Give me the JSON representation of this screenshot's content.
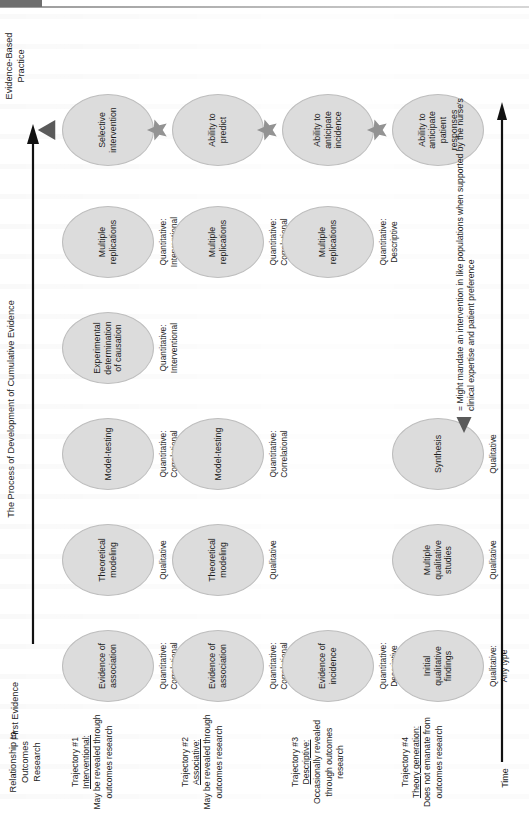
{
  "figure": {
    "process_axis_label": "The Process of Development of Cumulative Evidence",
    "time_axis_label": "Time",
    "first_evidence_header": "First Evidence",
    "evidence_based_practice_header": "Evidence-Based\nPractice",
    "row_descriptor_header": "Relationship to\nOutcomes\nResearch"
  },
  "colors": {
    "node_fill": "#dcdcdc",
    "node_stroke": "#bdbdbd",
    "marker_gray": "#939393",
    "triangle_dark": "#5a5a5a",
    "text": "#1d1d1d",
    "axis": "#111111",
    "page": "#ffffff"
  },
  "legend": {
    "marker": "triangle",
    "equals_sign": "=",
    "text": "Might mandate an intervention in like populations when supported by the nurse's clinical expertise and patient preference"
  },
  "rows": [
    {
      "id": "trajectory-1",
      "name": "Trajectory #1",
      "kind": "Interventional:",
      "note": "May be revealed through outcomes research",
      "end_marker": "triangle",
      "nodes": [
        {
          "col": 0,
          "label": "Evidence of association",
          "sublabel": "Quantitative:\nCorrelational"
        },
        {
          "col": 1,
          "label": "Theoretical modeling",
          "sublabel": "Qualitative"
        },
        {
          "col": 2,
          "label": "Model-testing",
          "sublabel": "Quantitative:\nCorrelational"
        },
        {
          "col": 3,
          "label": "Experimental determination of causation",
          "sublabel": "Quantitative:\nInterventional"
        },
        {
          "col": 4,
          "label": "Multiple replications",
          "sublabel": "Quantitative:\nInterventional"
        },
        {
          "col": 5,
          "label": "Selective intervention",
          "sublabel": ""
        }
      ]
    },
    {
      "id": "trajectory-2",
      "name": "Trajectory #2",
      "kind": "Associative:",
      "note": "May be revealed through outcomes research",
      "end_marker": "star",
      "nodes": [
        {
          "col": 0,
          "label": "Evidence of association",
          "sublabel": "Quantitative:\nCorrelational"
        },
        {
          "col": 1,
          "label": "Theoretical modeling",
          "sublabel": "Qualitative"
        },
        {
          "col": 2,
          "label": "Model-testing",
          "sublabel": "Quantitative:\nCorrelational"
        },
        {
          "col": 4,
          "label": "Multiple replications",
          "sublabel": "Quantitative:\nCorrelational"
        },
        {
          "col": 5,
          "label": "Ability to predict",
          "sublabel": ""
        }
      ]
    },
    {
      "id": "trajectory-3",
      "name": "Trajectory #3",
      "kind": "Descriptive:",
      "note": "Occasionally revealed through outcomes research",
      "end_marker": "star",
      "nodes": [
        {
          "col": 0,
          "label": "Evidence of incidence",
          "sublabel": "Quantitative:\nDescriptive"
        },
        {
          "col": 4,
          "label": "Multiple replications",
          "sublabel": "Quantitative:\nDescriptive"
        },
        {
          "col": 5,
          "label": "Ability to anticipate incidence",
          "sublabel": ""
        }
      ]
    },
    {
      "id": "trajectory-4",
      "name": "Trajectory #4",
      "kind": "Theory generation:",
      "note": "Does not emanate from outcomes research",
      "end_marker": "star",
      "nodes": [
        {
          "col": 0,
          "label": "Initial qualitative findings",
          "sublabel": "Qualitative:\nAny type"
        },
        {
          "col": 1,
          "label": "Multiple qualitative studies",
          "sublabel": "Qualitative"
        },
        {
          "col": 2,
          "label": "Synthesis",
          "sublabel": "Qualitative"
        },
        {
          "col": 5,
          "label": "Ability to anticipate patient responses",
          "sublabel": ""
        }
      ]
    }
  ]
}
